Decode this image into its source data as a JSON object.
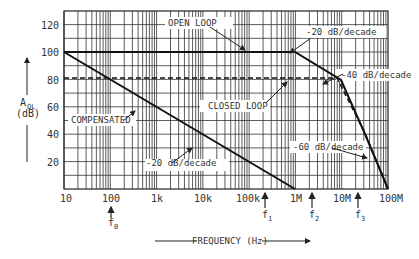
{
  "chart_data": {
    "type": "line",
    "title": "",
    "xlabel": "FREQUENCY (Hz)",
    "ylabel": "A_OL (dB)",
    "x_scale": "log",
    "xlim": [
      10,
      100000000
    ],
    "ylim": [
      0,
      130
    ],
    "grid": true,
    "x_ticks": [
      "10",
      "100",
      "1k",
      "10k",
      "100k",
      "1M",
      "10M",
      "100M"
    ],
    "y_ticks": [
      "20",
      "40",
      "60",
      "80",
      "100",
      "120"
    ],
    "series": [
      {
        "name": "OPEN LOOP",
        "style": "solid",
        "points": [
          [
            10,
            100
          ],
          [
            100000,
            100
          ],
          [
            1000000,
            80
          ],
          [
            10000000,
            40
          ],
          [
            100000000,
            0
          ]
        ]
      },
      {
        "name": "CLOSED LOOP",
        "style": "dashed",
        "points": [
          [
            10,
            78
          ],
          [
            1000000,
            78
          ],
          [
            10000000,
            38
          ],
          [
            100000000,
            0
          ]
        ]
      },
      {
        "name": "COMPENSATED",
        "style": "solid",
        "points": [
          [
            10,
            100
          ],
          [
            100000,
            0
          ]
        ]
      }
    ],
    "annotations": [
      "OPEN LOOP",
      "CLOSED LOOP",
      "COMPENSATED",
      "-20 dB/decade",
      "-40 dB/decade",
      "-60 dB/decade",
      "-20 dB/decade"
    ],
    "markers": [
      {
        "label": "f0",
        "x": 100
      },
      {
        "label": "f1",
        "x": 100000
      },
      {
        "label": "f2",
        "x": 1000000
      },
      {
        "label": "f3",
        "x": 10000000
      }
    ]
  },
  "labels": {
    "y_axis_main": "A",
    "y_axis_sub": "OL",
    "y_axis_unit": "(dB)",
    "x_axis": "FREQUENCY (Hz)",
    "open_loop": "OPEN LOOP",
    "closed_loop": "CLOSED LOOP",
    "compensated": "COMPENSATED",
    "slope_20_top": "-20 dB/decade",
    "slope_40": "-40 dB/decade",
    "slope_60": "-60 dB/decade",
    "slope_20_bottom": "-20 dB/decade",
    "f0": "f",
    "f0_sub": "0",
    "f1": "f",
    "f1_sub": "1",
    "f2": "f",
    "f2_sub": "2",
    "f3": "f",
    "f3_sub": "3",
    "x_ticks": [
      "10",
      "100",
      "1k",
      "10k",
      "100k",
      "1M",
      "10M",
      "100M"
    ],
    "y_ticks": [
      "20",
      "40",
      "60",
      "80",
      "100",
      "120"
    ]
  }
}
